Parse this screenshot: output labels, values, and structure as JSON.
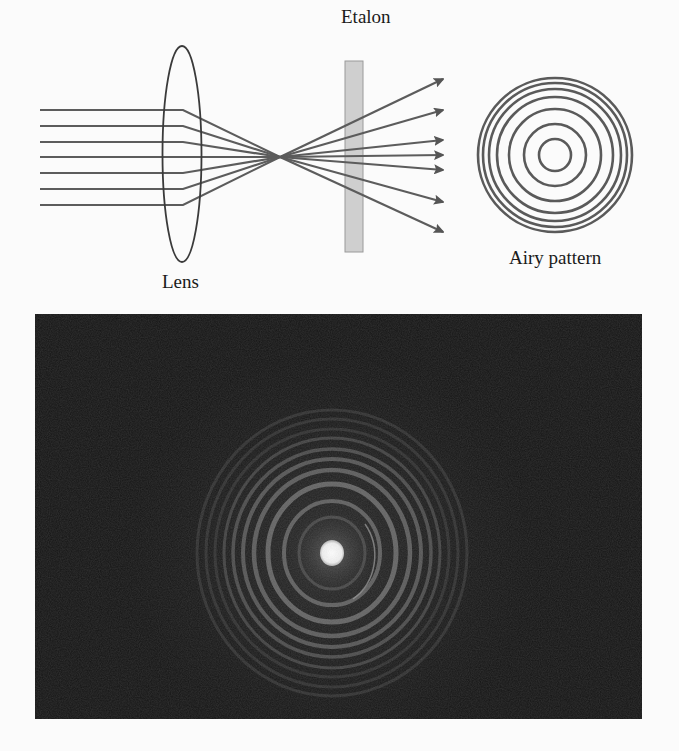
{
  "figure": {
    "diagram": {
      "labels": {
        "etalon": "Etalon",
        "lens": "Lens",
        "airy_pattern": "Airy pattern"
      },
      "colors": {
        "ray": "#5c5c5c",
        "lens_outline": "#3a3a3a",
        "etalon_fill": "#cfcfcf",
        "etalon_stroke": "#9a9a9a",
        "ring": "#5a5a5a"
      },
      "incoming_rays_count": 7,
      "outgoing_arrows_count": 7,
      "airy_rings_count": 7
    },
    "photo": {
      "description": "Fabry-Perot interference photograph showing concentric bright rings around a bright central spot",
      "background_color": "#141414",
      "center_spot_color": "#f4f4f4",
      "visible_bright_rings": 7
    }
  }
}
